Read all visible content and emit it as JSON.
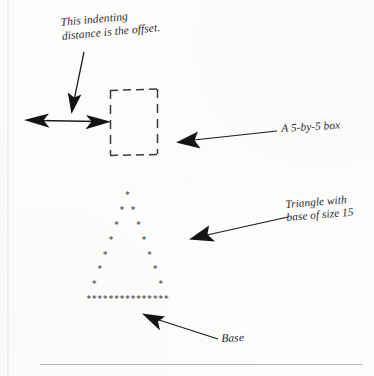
{
  "figure": {
    "background_color": "#fdfdfc",
    "ink_color": "#1a1a1a",
    "star_color": "#4a4a4a"
  },
  "annotations": {
    "offset_label": "This indenting\ndistance is the offset.",
    "box_label": "A 5-by-5 box",
    "triangle_label": "Triangle with\nbase of size 15",
    "base_label": "Base"
  },
  "box": {
    "description": "dashed square outline",
    "size_text": "5-by-5",
    "x": 110,
    "y": 90,
    "width": 48,
    "height": 65
  },
  "offset_measure": {
    "description": "double-headed horizontal arrow showing the indent offset",
    "x_start": 25,
    "x_end": 110,
    "y": 121
  },
  "stars": {
    "glyph": "*",
    "base_size": 15,
    "rows": [
      "       *       ",
      "      * *      ",
      "     *   *     ",
      "    *     *    ",
      "   *       *   ",
      "  *         *  ",
      " *           * ",
      "***************"
    ]
  },
  "rule": {
    "description": "horizontal separator line at bottom of page"
  }
}
